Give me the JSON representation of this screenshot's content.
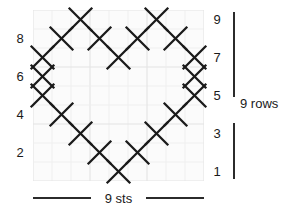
{
  "chart_data": {
    "type": "heatmap",
    "title": "",
    "xlabel": "9 sts",
    "ylabel": "9 rows",
    "grid": true,
    "legend_position": "none",
    "columns": 9,
    "rows": 9,
    "x": [
      1,
      2,
      3,
      4,
      5,
      6,
      7,
      8,
      9
    ],
    "y": [
      1,
      2,
      3,
      4,
      5,
      6,
      7,
      8,
      9
    ],
    "symbol": "X",
    "symbol_meaning": "stitch-marked-cell",
    "cells": [
      {
        "row": 9,
        "cols": [
          3,
          7
        ]
      },
      {
        "row": 8,
        "cols": [
          2,
          4,
          6,
          8
        ]
      },
      {
        "row": 7,
        "cols": [
          1,
          5,
          9
        ]
      },
      {
        "row": 6,
        "cols": [
          1,
          9
        ]
      },
      {
        "row": 5,
        "cols": [
          1,
          9
        ]
      },
      {
        "row": 4,
        "cols": [
          2,
          8
        ]
      },
      {
        "row": 3,
        "cols": [
          3,
          7
        ]
      },
      {
        "row": 2,
        "cols": [
          4,
          6
        ]
      },
      {
        "row": 1,
        "cols": [
          5
        ]
      }
    ],
    "values": [
      [
        0,
        0,
        1,
        0,
        0,
        0,
        1,
        0,
        0
      ],
      [
        0,
        1,
        0,
        1,
        0,
        1,
        0,
        1,
        0
      ],
      [
        1,
        0,
        0,
        0,
        1,
        0,
        0,
        0,
        1
      ],
      [
        1,
        0,
        0,
        0,
        0,
        0,
        0,
        0,
        1
      ],
      [
        1,
        0,
        0,
        0,
        0,
        0,
        0,
        0,
        1
      ],
      [
        0,
        1,
        0,
        0,
        0,
        0,
        0,
        1,
        0
      ],
      [
        0,
        0,
        1,
        0,
        0,
        0,
        1,
        0,
        0
      ],
      [
        0,
        0,
        0,
        1,
        0,
        1,
        0,
        0,
        0
      ],
      [
        0,
        0,
        0,
        0,
        1,
        0,
        0,
        0,
        0
      ]
    ],
    "values_row_order": "top-to-bottom (row 9 first, row 1 last)",
    "xlim": [
      0,
      9
    ],
    "ylim": [
      0,
      9
    ]
  },
  "axis": {
    "left_row_labels": [
      "8",
      "6",
      "4",
      "2"
    ],
    "left_row_numbers": [
      8,
      6,
      4,
      2
    ],
    "right_row_labels": [
      "9",
      "7",
      "5",
      "3",
      "1"
    ],
    "right_row_numbers": [
      9,
      7,
      5,
      3,
      1
    ]
  },
  "annotations": {
    "rows_bracket_label": "9 rows",
    "stitches_rule_label": "9 sts"
  },
  "colors": {
    "symbol": "#1a1a1a",
    "grid_line": "#ededed",
    "grid_line_major": "#e4e4e4",
    "grid_background": "#fbfbfb",
    "text": "#1a1a1a",
    "rule": "#2b2b2b",
    "page_background": "#ffffff"
  }
}
